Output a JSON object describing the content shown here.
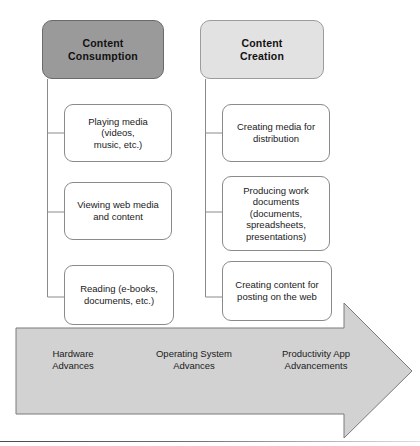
{
  "figure": {
    "type": "diagram",
    "layout": "two-column-tree-over-progress-arrow",
    "colors": {
      "header_dark_fill": "#9a9a9a",
      "header_light_fill": "#e2e2e2",
      "node_fill": "#ffffff",
      "node_stroke": "#8a8a8a",
      "arrow_fill": "#d2d2d2",
      "arrow_stroke": "#7a7a7a",
      "text": "#1a1a1a"
    }
  },
  "columns": [
    {
      "id": "content-consumption",
      "header": "Content\nConsumption",
      "header_style": "dark",
      "children": [
        "Playing media (videos,\nmusic, etc.)",
        "Viewing web media\nand content",
        "Reading (e-books,\ndocuments, etc.)"
      ]
    },
    {
      "id": "content-creation",
      "header": "Content\nCreation",
      "header_style": "light",
      "children": [
        "Creating media for\ndistribution",
        "Producing work\ndocuments\n(documents,\nspreadsheets,\npresentations)",
        "Creating content for\nposting on the web"
      ]
    }
  ],
  "arrow": {
    "direction": "right",
    "labels": [
      "Hardware\nAdvances",
      "Operating System\nAdvances",
      "Productivity App\nAdvancements"
    ]
  }
}
